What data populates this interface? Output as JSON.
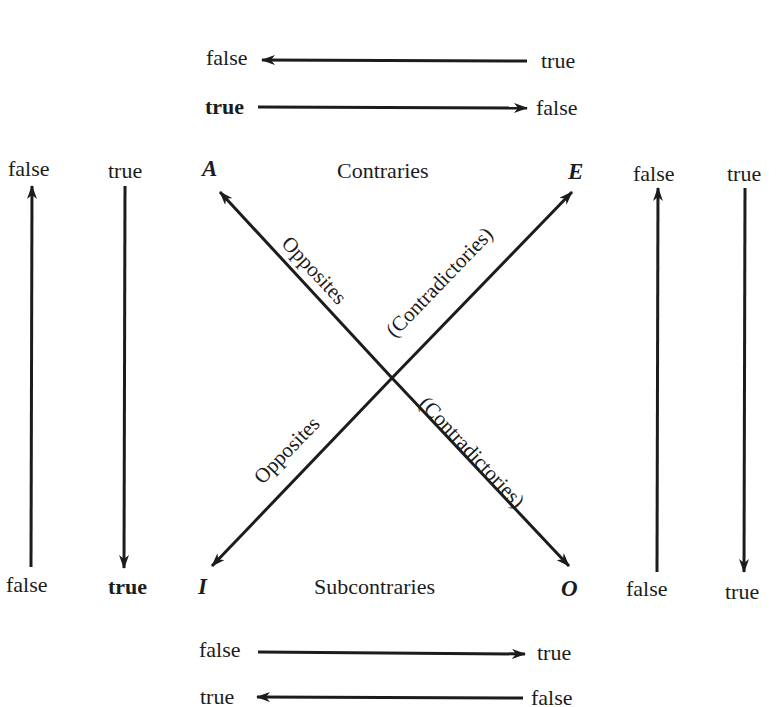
{
  "diagram": {
    "type": "square-of-opposition",
    "corners": {
      "a": "A",
      "e": "E",
      "i": "I",
      "o": "O"
    },
    "relations": {
      "top": "Contraries",
      "bottom": "Subcontraries",
      "diagonal_a_o_upper": "Opposites",
      "diagonal_e_i_upper": "(Contradictories)",
      "diagonal_i_e_lower": "Opposites",
      "diagonal_o_a_lower": "(Contradictories)"
    },
    "top_arrows": [
      {
        "left": "false",
        "right": "true",
        "direction": "left"
      },
      {
        "left": "true",
        "right": "false",
        "direction": "right"
      }
    ],
    "bottom_arrows": [
      {
        "left": "false",
        "right": "true",
        "direction": "right"
      },
      {
        "left": "true",
        "right": "false",
        "direction": "left"
      }
    ],
    "left_arrows": [
      {
        "top": "false",
        "bottom": "false",
        "direction": "up"
      },
      {
        "top": "true",
        "bottom": "true",
        "direction": "down"
      }
    ],
    "right_arrows": [
      {
        "top": "false",
        "bottom": "false",
        "direction": "up"
      },
      {
        "top": "true",
        "bottom": "true",
        "direction": "down"
      }
    ]
  }
}
